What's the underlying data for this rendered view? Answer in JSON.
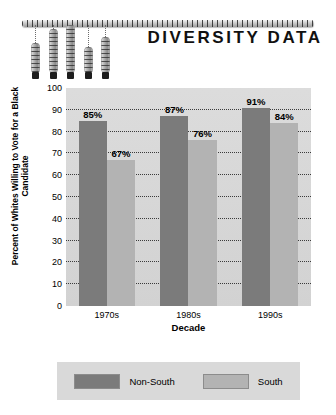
{
  "header": {
    "title": "DIVERSITY DATA",
    "decoration": {
      "ruler_name": "scale-ruler",
      "hangers": [
        {
          "height": 30,
          "left": 31
        },
        {
          "height": 44,
          "left": 49
        },
        {
          "height": 48,
          "left": 66
        },
        {
          "height": 26,
          "left": 84
        },
        {
          "height": 36,
          "left": 101
        }
      ]
    }
  },
  "chart_data": {
    "type": "bar",
    "title": "DIVERSITY DATA",
    "xlabel": "Decade",
    "ylabel": "Percent of Whites Willing to Vote for a Black Candidate",
    "categories": [
      "1970s",
      "1980s",
      "1990s"
    ],
    "series": [
      {
        "name": "Non-South",
        "color": "#7b7b7b",
        "values": [
          85,
          87,
          91
        ],
        "labels": [
          "85%",
          "87%",
          "91%"
        ]
      },
      {
        "name": "South",
        "color": "#b3b3b3",
        "values": [
          67,
          76,
          84
        ],
        "labels": [
          "67%",
          "76%",
          "84%"
        ]
      }
    ],
    "ylim": [
      0,
      100
    ],
    "yticks": [
      0,
      10,
      20,
      30,
      40,
      50,
      60,
      70,
      80,
      90,
      100
    ],
    "ytick_labels": [
      "0",
      "10",
      "20",
      "30",
      "40",
      "50",
      "60",
      "70",
      "80",
      "90",
      "100"
    ],
    "grid": true,
    "grid_style": "dotted",
    "legend_position": "bottom",
    "plot_background": "#d8d8d8"
  },
  "legend": {
    "items": [
      {
        "label": "Non-South",
        "color": "#7b7b7b"
      },
      {
        "label": "South",
        "color": "#b3b3b3"
      }
    ]
  }
}
